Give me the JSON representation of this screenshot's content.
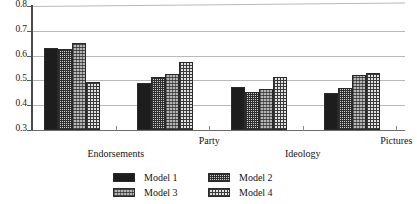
{
  "chart_data": {
    "type": "bar",
    "title": "",
    "xlabel": "",
    "ylabel": "",
    "ylim": [
      0.3,
      0.8
    ],
    "ytick_labels": [
      "0.8",
      "0.7",
      "0.6",
      "0.5",
      "0.4",
      "0.3"
    ],
    "ytick_values": [
      0.8,
      0.7,
      0.6,
      0.5,
      0.4,
      0.3
    ],
    "grid": true,
    "legend_position": "bottom",
    "categories": [
      "Endorsements",
      "Party",
      "Ideology",
      "Pictures"
    ],
    "series": [
      {
        "name": "Model 1",
        "pattern": "solid-black",
        "values": [
          0.632,
          0.49,
          0.475,
          0.45
        ]
      },
      {
        "name": "Model 2",
        "pattern": "fine-grid",
        "values": [
          0.625,
          0.512,
          0.455,
          0.47
        ]
      },
      {
        "name": "Model 3",
        "pattern": "gray-stipple",
        "values": [
          0.65,
          0.525,
          0.465,
          0.52
        ]
      },
      {
        "name": "Model 4",
        "pattern": "coarse-checker",
        "values": [
          0.495,
          0.573,
          0.515,
          0.528
        ]
      }
    ]
  },
  "legend": {
    "entries": [
      {
        "label": "Model 1"
      },
      {
        "label": "Model 2"
      },
      {
        "label": "Model 3"
      },
      {
        "label": "Model 4"
      }
    ]
  }
}
